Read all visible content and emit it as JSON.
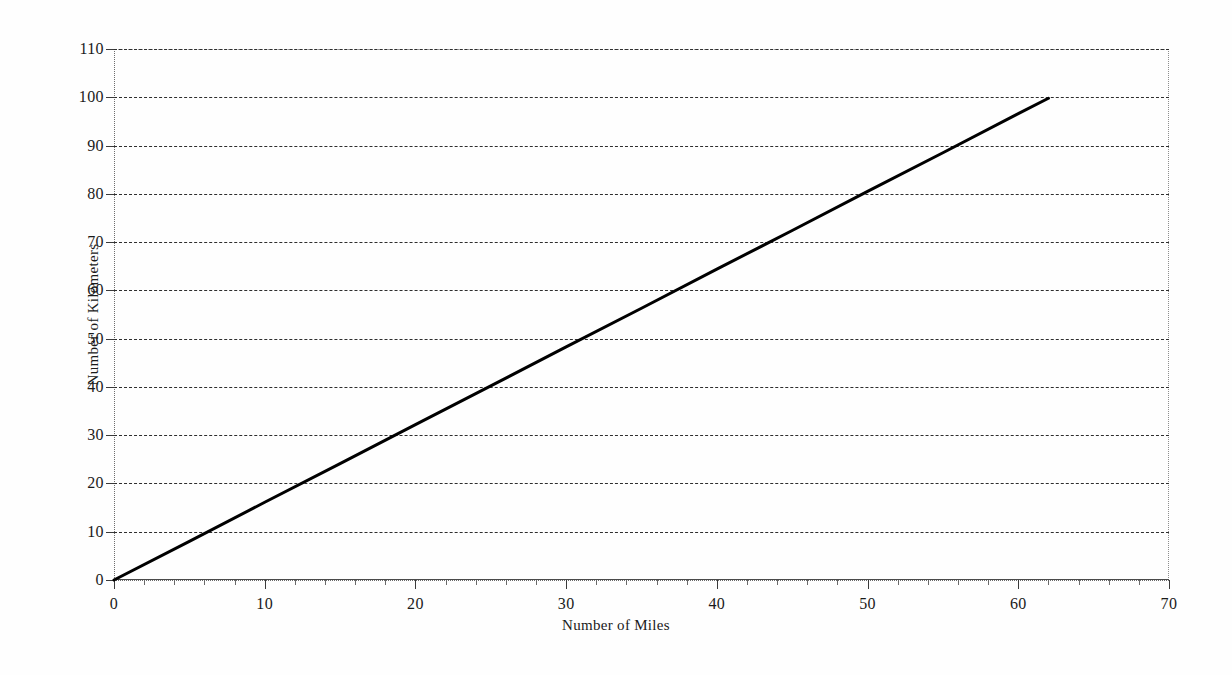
{
  "chart_data": {
    "type": "line",
    "title": "",
    "xlabel": "Number of Miles",
    "ylabel": "Number of Kilometers",
    "xlim": [
      0,
      70
    ],
    "ylim": [
      0,
      110
    ],
    "x_ticks": [
      0,
      10,
      20,
      30,
      40,
      50,
      60,
      70
    ],
    "x_tick_labels": [
      "0",
      "10",
      "20",
      "30",
      "40",
      "50",
      "60",
      "70"
    ],
    "x_minor_tick_step": 2,
    "y_ticks": [
      0,
      10,
      20,
      30,
      40,
      50,
      60,
      70,
      80,
      90,
      100,
      110
    ],
    "y_tick_labels": [
      "0",
      "10",
      "20",
      "30",
      "40",
      "50",
      "60",
      "70",
      "80",
      "90",
      "100",
      "110"
    ],
    "grid": "horizontal-dashed",
    "legend": "none",
    "series": [
      {
        "name": "Miles to Kilometers conversion",
        "line_color": "#000000",
        "line_width": 3,
        "x": [
          0,
          5,
          10,
          15,
          20,
          25,
          30,
          35,
          40,
          45,
          50,
          55,
          60,
          62
        ],
        "values": [
          0,
          8,
          16.1,
          24.1,
          32.2,
          40.2,
          48.3,
          56.3,
          64.4,
          72.4,
          80.5,
          88.5,
          96.6,
          99.8
        ]
      }
    ],
    "annotations": []
  },
  "axes": {
    "x_title": "Number of Miles",
    "y_title": "Number of Kilometers"
  },
  "colors": {
    "background": "#fefefe",
    "gridline": "#2e2e2e",
    "frame": "#8d8d8d",
    "series_line": "#000000",
    "text": "#1a1a1a"
  }
}
